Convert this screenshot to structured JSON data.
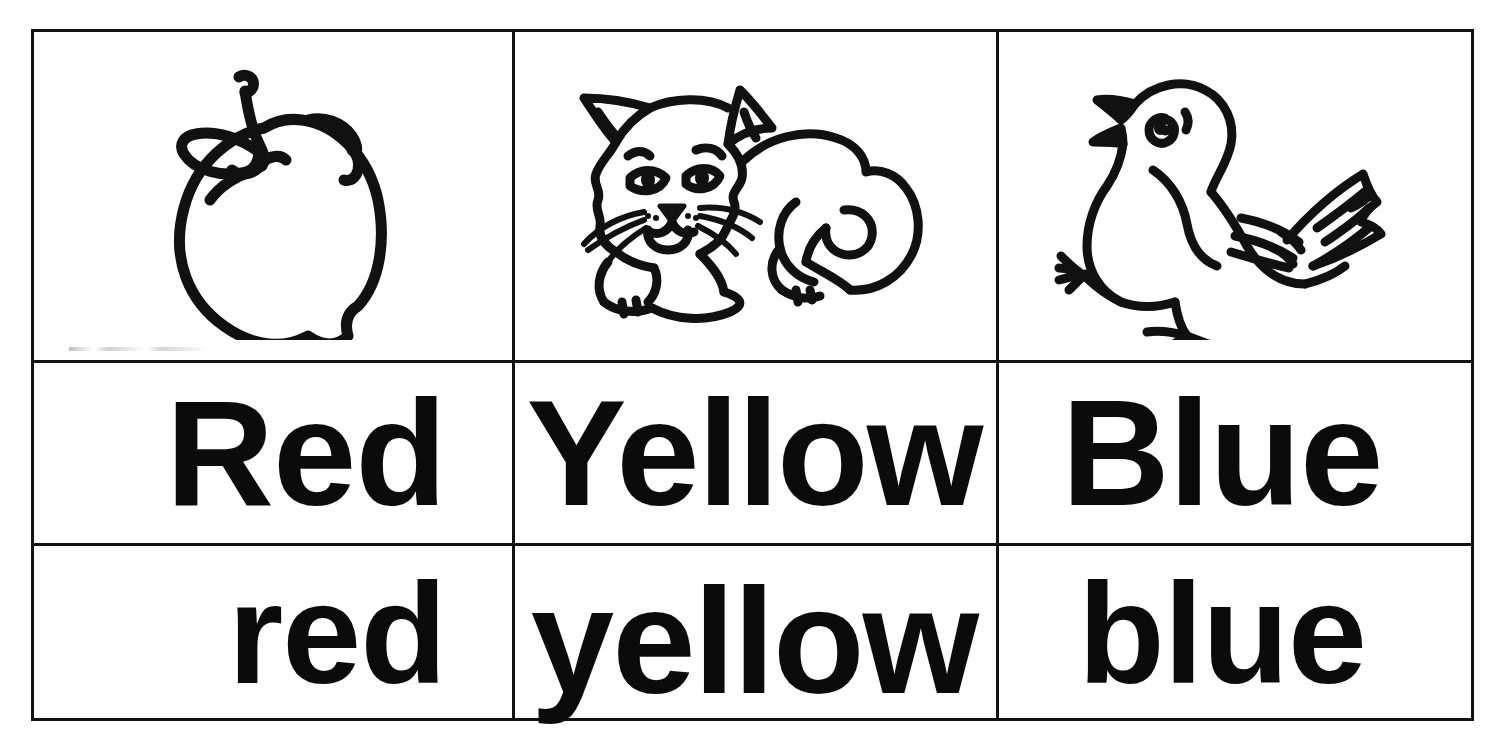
{
  "worksheet": {
    "title": "Color Words Chart",
    "columns": [
      {
        "picture_name": "apple-illustration",
        "picture_label": "apple",
        "capitalized_word": "Red",
        "lowercase_word": "red"
      },
      {
        "picture_name": "cat-illustration",
        "picture_label": "cat",
        "capitalized_word": "Yellow",
        "lowercase_word": "yellow"
      },
      {
        "picture_name": "bird-illustration",
        "picture_label": "bird",
        "capitalized_word": "Blue",
        "lowercase_word": "blue"
      }
    ],
    "colors": {
      "ink": "#121212",
      "paper": "#ffffff",
      "text": "#0b0b0b"
    }
  }
}
